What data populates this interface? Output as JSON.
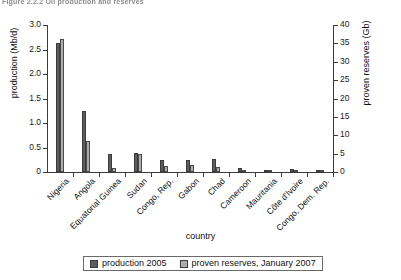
{
  "caption": "Figure 2.2.2   Oil production and reserves",
  "legend": {
    "position": "bottom-center",
    "items": [
      {
        "label": "production 2005",
        "color": "#5d5d5d",
        "key": "production"
      },
      {
        "label": "proven reserves, January 2007",
        "color": "#adadad",
        "key": "reserves"
      }
    ]
  },
  "axes": {
    "left": {
      "title": "production (Mb/d)",
      "ticks": [
        "0",
        "0.5",
        "1.0",
        "1.5",
        "2.0",
        "2.5",
        "3.0"
      ],
      "min": 0,
      "max": 3.0,
      "step": 0.5
    },
    "right": {
      "title": "proven reserves (Gb)",
      "ticks": [
        "0",
        "5",
        "10",
        "15",
        "20",
        "25",
        "30",
        "35",
        "40"
      ],
      "min": 0,
      "max": 40,
      "step": 5
    },
    "bottom": {
      "title": "country"
    }
  },
  "chart_data": {
    "type": "bar",
    "title": "Figure 2.2.2   Oil production and reserves",
    "xlabel": "country",
    "ylabel": "production (Mb/d)",
    "ylabel_secondary": "proven reserves (Gb)",
    "ylim": [
      0,
      3.0
    ],
    "ylim_secondary": [
      0,
      40
    ],
    "grid": false,
    "legend_position": "bottom-center",
    "categories": [
      "Nigeria",
      "Angola",
      "Equatorial Guinea",
      "Sudan",
      "Congo, Rep.",
      "Gabon",
      "Chad",
      "Cameroon",
      "Mauritania",
      "Côte d'Ivoire",
      "Congo, Dem. Rep."
    ],
    "series": [
      {
        "name": "production 2005",
        "unit": "Mb/d",
        "axis": "left",
        "color": "#5d5d5d",
        "values": [
          2.63,
          1.25,
          0.37,
          0.38,
          0.24,
          0.24,
          0.27,
          0.09,
          0.04,
          0.06,
          0.02
        ]
      },
      {
        "name": "proven reserves, January 2007",
        "unit": "Gb",
        "axis": "right",
        "color": "#adadad",
        "values": [
          36.2,
          8.4,
          1.1,
          5.0,
          1.6,
          2.0,
          1.5,
          0.4,
          0.1,
          0.1,
          0.2
        ]
      }
    ]
  }
}
